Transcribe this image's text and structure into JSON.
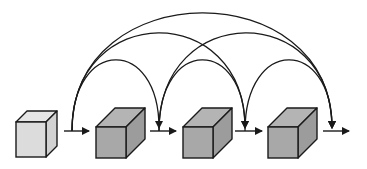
{
  "diagram": {
    "title": "",
    "colors": {
      "stroke": "#1a1a1a",
      "input_cube_front": "#dcdcdc",
      "input_cube_top": "#e6e6e6",
      "input_cube_side": "#d2d2d2",
      "block_cube_front": "#a8a8a8",
      "block_cube_top": "#b4b4b4",
      "block_cube_side": "#9c9c9c",
      "background": "#ffffff"
    },
    "nodes": [
      {
        "id": "input",
        "kind": "input-cube",
        "front": {
          "x": 16,
          "y": 122,
          "w": 30,
          "h": 35
        },
        "depth": 11
      },
      {
        "id": "block1",
        "kind": "block-cube",
        "front": {
          "x": 96,
          "y": 127,
          "w": 30,
          "h": 31
        },
        "depth": 19
      },
      {
        "id": "block2",
        "kind": "block-cube",
        "front": {
          "x": 183,
          "y": 127,
          "w": 30,
          "h": 31
        },
        "depth": 19
      },
      {
        "id": "block3",
        "kind": "block-cube",
        "front": {
          "x": 268,
          "y": 127,
          "w": 30,
          "h": 31
        },
        "depth": 19
      }
    ],
    "junctions": [
      {
        "id": "j0",
        "x": 72,
        "arrow_from": 64,
        "arrow_to": 89
      },
      {
        "id": "j1",
        "x": 158,
        "arrow_from": 150,
        "arrow_to": 176
      },
      {
        "id": "j2",
        "x": 244,
        "arrow_from": 235,
        "arrow_to": 262
      },
      {
        "id": "j3",
        "x": 332,
        "arrow_from": 323,
        "arrow_to": 349
      }
    ],
    "arrow_y": 131,
    "skip_connections": [
      {
        "from": "j0",
        "to": "j1",
        "x1": 72,
        "x2": 159,
        "peak_y": 60
      },
      {
        "from": "j0",
        "to": "j2",
        "x1": 72,
        "x2": 245,
        "peak_y": 33
      },
      {
        "from": "j0",
        "to": "j3",
        "x1": 72,
        "x2": 332,
        "peak_y": 13
      },
      {
        "from": "j1",
        "to": "j2",
        "x1": 159,
        "x2": 245,
        "peak_y": 60
      },
      {
        "from": "j1",
        "to": "j3",
        "x1": 159,
        "x2": 332,
        "peak_y": 33
      },
      {
        "from": "j2",
        "to": "j3",
        "x1": 245,
        "x2": 332,
        "peak_y": 60
      }
    ]
  }
}
